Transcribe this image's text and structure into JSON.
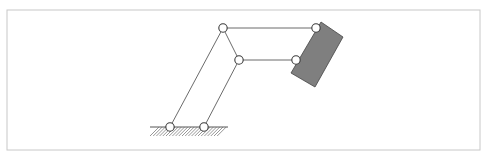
{
  "figure": {
    "type": "four-bar linkage / parallel mechanism schematic",
    "frame": {
      "x": 7,
      "y": 10,
      "width": 473,
      "height": 140,
      "stroke": "#c8c8c8"
    },
    "joint_radius": 4.2,
    "joints": [
      {
        "id": "ground-left",
        "x": 170,
        "y": 127
      },
      {
        "id": "ground-right",
        "x": 204,
        "y": 127
      },
      {
        "id": "top-left",
        "x": 223,
        "y": 28
      },
      {
        "id": "middle",
        "x": 239,
        "y": 60
      },
      {
        "id": "top-right",
        "x": 316,
        "y": 28
      },
      {
        "id": "lower-right",
        "x": 296,
        "y": 60
      }
    ],
    "links": [
      {
        "from": "ground-left",
        "to": "top-left"
      },
      {
        "from": "ground-right",
        "to": "middle"
      },
      {
        "from": "top-left",
        "to": "middle"
      },
      {
        "from": "top-left",
        "to": "top-right"
      },
      {
        "from": "middle",
        "to": "lower-right"
      }
    ],
    "ground": {
      "x1": 150,
      "x2": 228,
      "y": 127,
      "hatch_depth": 9,
      "hatch_spacing": 3.2
    },
    "end_effector": {
      "points": [
        [
          321,
          22
        ],
        [
          343,
          37
        ],
        [
          315,
          87
        ],
        [
          291,
          73
        ]
      ],
      "fill": "#7f7f7f"
    }
  }
}
